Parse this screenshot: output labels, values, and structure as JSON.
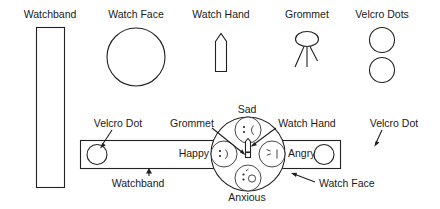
{
  "figure": {
    "background_color": "#ffffff",
    "line_color": "#222222",
    "text_color": "#1a1a1a"
  },
  "legend": {
    "items": [
      {
        "id": "watchband",
        "label": "Watchband",
        "icon": "tall-rectangle-icon"
      },
      {
        "id": "watch-face",
        "label": "Watch Face",
        "icon": "circle-icon"
      },
      {
        "id": "watch-hand",
        "label": "Watch Hand",
        "icon": "pointer-hand-icon"
      },
      {
        "id": "grommet",
        "label": "Grommet",
        "icon": "grommet-rivet-icon"
      },
      {
        "id": "velcro-dots",
        "label": "Velcro Dots",
        "icon": "two-circles-icon"
      }
    ]
  },
  "assembly": {
    "callouts": [
      {
        "id": "velcro-dot-left",
        "label": "Velcro Dot"
      },
      {
        "id": "grommet",
        "label": "Grommet"
      },
      {
        "id": "watch-hand",
        "label": "Watch Hand"
      },
      {
        "id": "velcro-dot-right",
        "label": "Velcro Dot"
      },
      {
        "id": "watchband",
        "label": "Watchband"
      },
      {
        "id": "watch-face",
        "label": "Watch Face"
      }
    ],
    "emotions": [
      {
        "id": "sad",
        "label": "Sad",
        "position": "top",
        "emoticon": ":("
      },
      {
        "id": "happy",
        "label": "Happy",
        "position": "left",
        "emoticon": ":)"
      },
      {
        "id": "angry",
        "label": "Angry",
        "position": "right",
        "emoticon": ">:|"
      },
      {
        "id": "anxious",
        "label": "Anxious",
        "position": "bottom",
        "emoticon": ":o"
      }
    ]
  }
}
